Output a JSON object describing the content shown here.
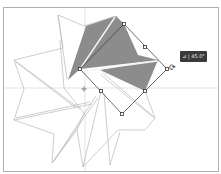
{
  "canvas": {
    "background": "#ffffff",
    "border_color": "#b0b0b0",
    "guide_color": "#d8d8d8",
    "stroke_color": "#b8b8b8",
    "fill_color": "#8a8a8a",
    "selection_color": "#444444"
  },
  "guides": {
    "vertical_x": 85,
    "horizontal_y": 88
  },
  "tooltip": {
    "icon": "angle-icon",
    "label": "⊿ | 45.0°"
  },
  "rotate_cursor": {
    "glyph": "⟳"
  },
  "selection": {
    "rotation_deg": 45,
    "handles": [
      [
        124,
        24
      ],
      [
        145,
        47
      ],
      [
        167,
        69
      ],
      [
        145,
        91
      ],
      [
        122,
        114
      ],
      [
        101,
        91
      ],
      [
        80,
        69
      ]
    ],
    "center": [
      102,
      46
    ],
    "pivot": [
      84,
      89
    ]
  }
}
